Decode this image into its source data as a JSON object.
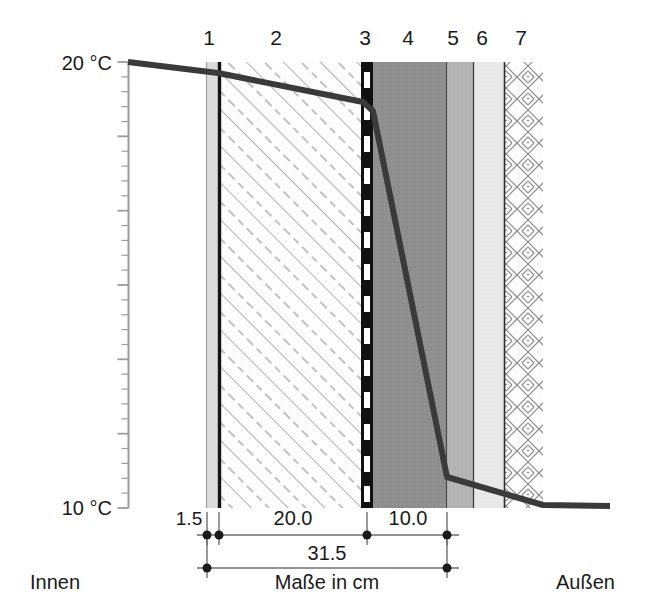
{
  "figure": {
    "title_caption": "Maße in cm",
    "side_labels": {
      "inner": "Innen",
      "outer": "Außen"
    },
    "axis": {
      "top_label": "20 °C",
      "bottom_label": "10 °C",
      "top_value": 20,
      "bottom_value": 10,
      "unit": "°C",
      "x_px": 128,
      "y_top_px": 62,
      "y_bottom_px": 508,
      "major_tick_every": 5,
      "minor_tick_count": 30
    },
    "layer_numbers": [
      {
        "label": "1",
        "x": 209
      },
      {
        "label": "2",
        "x": 276
      },
      {
        "label": "3",
        "x": 365
      },
      {
        "label": "4",
        "x": 408
      },
      {
        "label": "5",
        "x": 453
      },
      {
        "label": "6",
        "x": 482
      },
      {
        "label": "7",
        "x": 521
      }
    ],
    "layers": [
      {
        "id": "1",
        "pattern": "solid-light-gray",
        "color": "#dcdcdc",
        "x0": 206,
        "x1": 218
      },
      {
        "id": "2",
        "pattern": "diagonal-hatch",
        "color": "#fdfdfd",
        "x0": 218,
        "x1": 361
      },
      {
        "id": "3",
        "pattern": "black-dashed-barrier",
        "color": "#111111",
        "x0": 361,
        "x1": 373
      },
      {
        "id": "4",
        "pattern": "solid-mid-gray",
        "color": "#8f8f8f",
        "x0": 373,
        "x1": 446
      },
      {
        "id": "5",
        "pattern": "solid-gray",
        "color": "#b4b4b4",
        "x0": 446,
        "x1": 473
      },
      {
        "id": "6",
        "pattern": "solid-light",
        "color": "#e8e8e8",
        "x0": 473,
        "x1": 504
      },
      {
        "id": "7",
        "pattern": "herringbone-hatch",
        "color": "#fdfdfd",
        "x0": 504,
        "x1": 543
      }
    ],
    "dimensions": {
      "row1": [
        {
          "value": "1.5",
          "x0": 207,
          "x1": 219,
          "label_x": 189,
          "label_y": 522
        },
        {
          "value": "20.0",
          "x0": 219,
          "x1": 367,
          "label_x": 293,
          "label_y": 522
        },
        {
          "value": "10.0",
          "x0": 367,
          "x1": 447,
          "label_x": 408,
          "label_y": 522
        }
      ],
      "row2": [
        {
          "value": "31.5",
          "x0": 207,
          "x1": 447,
          "label_x": 327,
          "label_y": 557
        }
      ],
      "row1_y": 535,
      "row2_y": 568
    }
  },
  "chart_data": {
    "type": "line",
    "xlabel": "Maße in cm",
    "ylabel": "°C",
    "ylim": [
      10,
      20
    ],
    "grid": false,
    "legend": "none",
    "annotations": [
      "Innen",
      "Außen",
      "Maße in cm"
    ],
    "layer_thickness_cm": {
      "1": 1.5,
      "2": 20.0,
      "3_to_4": 10.0,
      "total_1_to_4": 31.5
    },
    "series": [
      {
        "name": "Temperaturverlauf",
        "points_px": [
          [
            128,
            62
          ],
          [
            218,
            73
          ],
          [
            363,
            102
          ],
          [
            373,
            111
          ],
          [
            447,
            477
          ],
          [
            543,
            505
          ],
          [
            610,
            506
          ]
        ],
        "points_temp": [
          {
            "x_cm": -2.0,
            "t": 20.0
          },
          {
            "x_cm": 0.0,
            "t": 19.75
          },
          {
            "x_cm": 1.5,
            "t": 19.1
          },
          {
            "x_cm": 21.5,
            "t": 18.9
          },
          {
            "x_cm": 21.8,
            "t": 10.7
          },
          {
            "x_cm": 31.5,
            "t": 10.05
          },
          {
            "x_cm": 36.0,
            "t": 10.0
          }
        ]
      }
    ]
  }
}
